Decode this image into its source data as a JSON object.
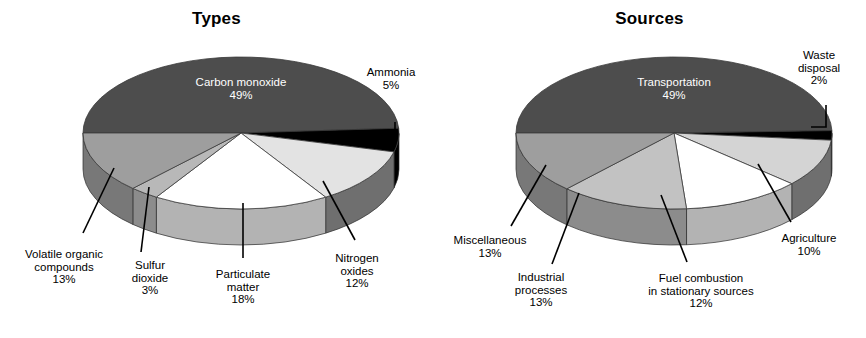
{
  "figure": {
    "background": "#ffffff",
    "width": 866,
    "height": 338
  },
  "charts": [
    {
      "id": "types",
      "title": "Types",
      "center": {
        "x": 241,
        "y": 133
      },
      "rx": 158,
      "ry": 76,
      "depth": 36,
      "start_angle_deg": 180,
      "inner_label": {
        "text": "Carbon monoxide\n49%",
        "x": 241,
        "y": 88
      },
      "slices": [
        {
          "name": "Carbon monoxide",
          "value": 49,
          "pct_label": "49%",
          "color": "#4d4d4d",
          "side_color": "#3b3b3b"
        },
        {
          "name": "Ammonia",
          "value": 5,
          "pct_label": "5%",
          "color": "#000000",
          "side_color": "#000000"
        },
        {
          "name": "Nitrogen oxides",
          "value": 12,
          "pct_label": "12%",
          "color": "#e3e3e3",
          "side_color": "#6f6f6f"
        },
        {
          "name": "Particulate matter",
          "value": 18,
          "pct_label": "18%",
          "color": "#ffffff",
          "side_color": "#b3b3b3"
        },
        {
          "name": "Sulfur dioxide",
          "value": 3,
          "pct_label": "3%",
          "color": "#b8b8b8",
          "side_color": "#8c8c8c"
        },
        {
          "name": "Volatile organic compounds",
          "value": 13,
          "pct_label": "13%",
          "color": "#9e9e9e",
          "side_color": "#787878"
        }
      ],
      "callouts": [
        {
          "name": "ammonia",
          "text": "Ammonia\n5%",
          "text_x": 352,
          "text_y": 66,
          "text_w": 78,
          "leader": "elbow",
          "path": "M 395 122 L 395 131 L 381 131"
        },
        {
          "name": "nitrogen-oxides",
          "text": "Nitrogen\noxides\n12%",
          "text_x": 318,
          "text_y": 252,
          "text_w": 78,
          "leader": "line",
          "path": "M 355 240 L 323 181"
        },
        {
          "name": "particulate-matter",
          "text": "Particulate\nmatter\n18%",
          "text_x": 198,
          "text_y": 268,
          "text_w": 90,
          "leader": "line",
          "path": "M 243 258 L 243 203"
        },
        {
          "name": "sulfur-dioxide",
          "text": "Sulfur\ndioxide\n3%",
          "text_x": 112,
          "text_y": 259,
          "text_w": 76,
          "leader": "line",
          "path": "M 141 252 L 149 187"
        },
        {
          "name": "volatile-organic-compounds",
          "text": "Volatile organic\ncompounds\n13%",
          "text_x": 9,
          "text_y": 248,
          "text_w": 110,
          "leader": "line",
          "path": "M 83 233 L 114 168"
        }
      ]
    },
    {
      "id": "sources",
      "title": "Sources",
      "center": {
        "x": 241,
        "y": 133
      },
      "rx": 158,
      "ry": 76,
      "depth": 36,
      "start_angle_deg": 180,
      "inner_label": {
        "text": "Transportation\n49%",
        "x": 241,
        "y": 88
      },
      "slices": [
        {
          "name": "Transportation",
          "value": 49,
          "pct_label": "49%",
          "color": "#4d4d4d",
          "side_color": "#3b3b3b"
        },
        {
          "name": "Waste disposal",
          "value": 2,
          "pct_label": "2%",
          "color": "#000000",
          "side_color": "#000000"
        },
        {
          "name": "Agriculture",
          "value": 10,
          "pct_label": "10%",
          "color": "#d4d4d4",
          "side_color": "#6f6f6f"
        },
        {
          "name": "Fuel combustion in stationary sources",
          "value": 12,
          "pct_label": "12%",
          "color": "#ffffff",
          "side_color": "#b3b3b3"
        },
        {
          "name": "Industrial processes",
          "value": 13,
          "pct_label": "13%",
          "color": "#c2c2c2",
          "side_color": "#8c8c8c"
        },
        {
          "name": "Miscellaneous",
          "value": 13,
          "pct_label": "13%",
          "color": "#9e9e9e",
          "side_color": "#787878"
        }
      ],
      "callouts": [
        {
          "name": "waste-disposal",
          "text": "Waste\ndisposal\n2%",
          "text_x": 346,
          "text_y": 49,
          "text_w": 80,
          "leader": "elbow",
          "path": "M 393 105 L 393 127 L 378 127"
        },
        {
          "name": "agriculture",
          "text": "Agriculture\n10%",
          "text_x": 331,
          "text_y": 232,
          "text_w": 90,
          "leader": "line",
          "path": "M 358 222 L 325 164"
        },
        {
          "name": "fuel-combustion",
          "text": "Fuel combustion\nin stationary sources\n12%",
          "text_x": 193,
          "text_y": 272,
          "text_w": 150,
          "leader": "line",
          "path": "M 254 262 L 228 195"
        },
        {
          "name": "industrial-processes",
          "text": "Industrial\nprocesses\n13%",
          "text_x": 60,
          "text_y": 271,
          "text_w": 96,
          "leader": "line",
          "path": "M 119 264 L 146 193"
        },
        {
          "name": "miscellaneous",
          "text": "Miscellaneous\n13%",
          "text_x": 1,
          "text_y": 234,
          "text_w": 112,
          "leader": "line",
          "path": "M 78 226 L 113 165"
        }
      ]
    }
  ]
}
